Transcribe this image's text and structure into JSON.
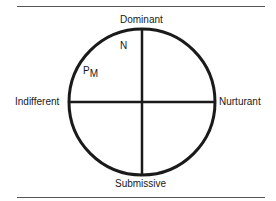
{
  "diagram": {
    "labels": {
      "top": "Dominant",
      "bottom": "Submissive",
      "left": "Indifferent",
      "right": "Nurturant"
    },
    "points": [
      {
        "label": "N"
      },
      {
        "label": "P",
        "subscript": "M"
      }
    ],
    "colors": {
      "line": "#1a1a1a",
      "rule": "#555555"
    }
  }
}
